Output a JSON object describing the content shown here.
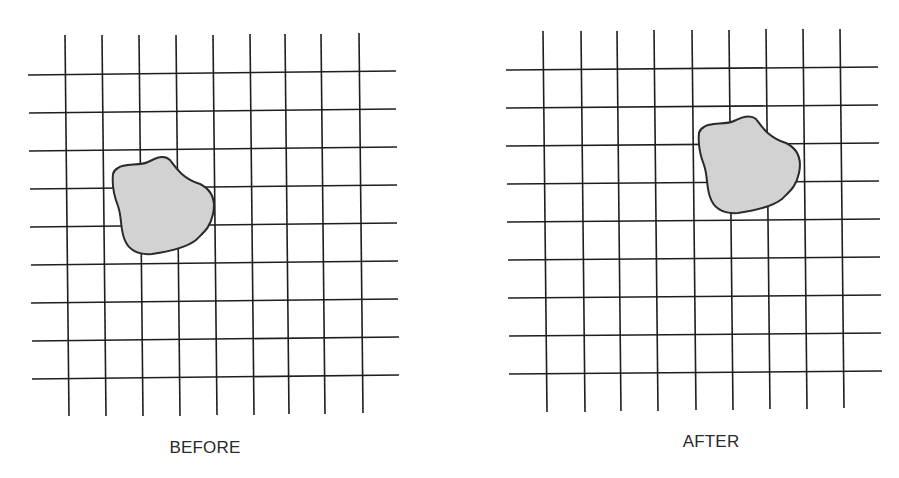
{
  "diagram": {
    "type": "before-after-grid-displacement",
    "colors": {
      "background": "#ffffff",
      "grid_line": "#1e1e1e",
      "blob_fill": "#d2d2d2",
      "blob_stroke": "#2a2a2a",
      "label": "#2a2a2a"
    },
    "panels": [
      {
        "id": "before",
        "label": "BEFORE",
        "label_pos": [
          205,
          452
        ],
        "grid": {
          "verticals": [
            [
              [
                65,
                35
              ],
              [
                69,
                416
              ]
            ],
            [
              [
                102,
                35
              ],
              [
                106,
                416
              ]
            ],
            [
              [
                139,
                35
              ],
              [
                143,
                416
              ]
            ],
            [
              [
                176,
                35
              ],
              [
                180,
                416
              ]
            ],
            [
              [
                213,
                35
              ],
              [
                217,
                415
              ]
            ],
            [
              [
                250,
                34
              ],
              [
                254,
                415
              ]
            ],
            [
              [
                285,
                34
              ],
              [
                289,
                414
              ]
            ],
            [
              [
                321,
                34
              ],
              [
                325,
                414
              ]
            ],
            [
              [
                359,
                33
              ],
              [
                363,
                413
              ]
            ]
          ],
          "horizontals": [
            [
              [
                28,
                75
              ],
              [
                396,
                71
              ]
            ],
            [
              [
                29,
                113
              ],
              [
                396,
                109
              ]
            ],
            [
              [
                29,
                151
              ],
              [
                397,
                147
              ]
            ],
            [
              [
                30,
                189
              ],
              [
                397,
                185
              ]
            ],
            [
              [
                30,
                227
              ],
              [
                397,
                223
              ]
            ],
            [
              [
                31,
                265
              ],
              [
                398,
                261
              ]
            ],
            [
              [
                31,
                303
              ],
              [
                398,
                299
              ]
            ],
            [
              [
                32,
                341
              ],
              [
                399,
                337
              ]
            ],
            [
              [
                32,
                379
              ],
              [
                399,
                375
              ]
            ]
          ]
        },
        "blob": {
          "path": "M 118 168 C 124 163, 140 166, 148 162 C 156 158, 164 154, 170 160 C 176 168, 182 178, 200 184 C 212 190, 216 200, 213 214 C 210 228, 204 232, 196 240 C 186 248, 166 252, 152 254 C 138 255, 128 250, 124 238 C 120 226, 122 218, 118 206 C 114 196, 112 184, 113 174 C 114 170, 116 169, 118 168 Z"
        }
      },
      {
        "id": "after",
        "label": "AFTER",
        "label_pos": [
          711,
          446
        ],
        "grid": {
          "verticals": [
            [
              [
                543,
                31
              ],
              [
                547,
                412
              ]
            ],
            [
              [
                581,
                31
              ],
              [
                585,
                412
              ]
            ],
            [
              [
                617,
                31
              ],
              [
                621,
                411
              ]
            ],
            [
              [
                654,
                30
              ],
              [
                658,
                411
              ]
            ],
            [
              [
                692,
                30
              ],
              [
                696,
                410
              ]
            ],
            [
              [
                729,
                30
              ],
              [
                733,
                410
              ]
            ],
            [
              [
                766,
                29
              ],
              [
                770,
                409
              ]
            ],
            [
              [
                803,
                29
              ],
              [
                807,
                409
              ]
            ],
            [
              [
                840,
                29
              ],
              [
                844,
                408
              ]
            ]
          ],
          "horizontals": [
            [
              [
                506,
                70
              ],
              [
                878,
                67
              ]
            ],
            [
              [
                506,
                108
              ],
              [
                878,
                105
              ]
            ],
            [
              [
                506,
                146
              ],
              [
                879,
                143
              ]
            ],
            [
              [
                507,
                184
              ],
              [
                879,
                181
              ]
            ],
            [
              [
                507,
                222
              ],
              [
                880,
                219
              ]
            ],
            [
              [
                508,
                260
              ],
              [
                880,
                257
              ]
            ],
            [
              [
                508,
                298
              ],
              [
                881,
                295
              ]
            ],
            [
              [
                509,
                336
              ],
              [
                881,
                333
              ]
            ],
            [
              [
                509,
                374
              ],
              [
                882,
                371
              ]
            ]
          ]
        },
        "blob": {
          "path": "M 704 127 C 710 122, 726 125, 734 121 C 742 117, 750 114, 756 119 C 762 127, 768 137, 786 143 C 798 149, 802 159, 799 173 C 796 187, 790 191, 782 199 C 772 207, 752 211, 738 213 C 724 214, 714 209, 710 197 C 706 185, 708 177, 704 165 C 700 155, 698 143, 699 133 C 700 129, 702 128, 704 127 Z"
        }
      }
    ]
  }
}
